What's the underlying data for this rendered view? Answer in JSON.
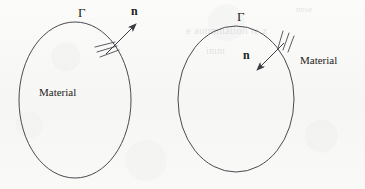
{
  "figure": {
    "background_color": "#f8f8f7",
    "ink_color": "#3a3a40",
    "text_color": "#1d1d20",
    "panels": [
      {
        "id": "left-panel",
        "description": "outward normal",
        "boundary_label": "Γ",
        "normal_label": "n",
        "material_label": "Material",
        "material_label_position": "inside",
        "normal_direction": "outward",
        "ellipse": {
          "cx": 75,
          "cy": 100,
          "rx": 56,
          "ry": 78
        },
        "arrow": {
          "x1": 108,
          "y1": 52,
          "x2": 137,
          "y2": 23
        },
        "hatch_count": 3
      },
      {
        "id": "right-panel",
        "description": "inward normal",
        "boundary_label": "Γ",
        "normal_label": "n",
        "material_label": "Material",
        "material_label_position": "outside",
        "normal_direction": "inward",
        "ellipse": {
          "cx": 236,
          "cy": 99,
          "rx": 58,
          "ry": 73
        },
        "arrow": {
          "x1": 283,
          "y1": 44,
          "x2": 256,
          "y2": 71
        },
        "hatch_count": 3
      }
    ]
  },
  "ghost_text": {
    "line_1": "nese",
    "line_2": "e aunmuation te z",
    "line_3": "imm"
  }
}
